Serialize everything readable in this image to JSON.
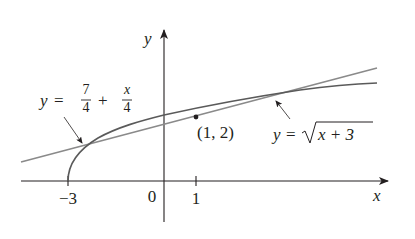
{
  "diagram": {
    "type": "function-graph",
    "axes": {
      "x_label": "x",
      "y_label": "y",
      "origin_label": "0",
      "x_ticks": [
        {
          "value": -3,
          "label": "−3"
        },
        {
          "value": 1,
          "label": "1"
        }
      ]
    },
    "curves": [
      {
        "name": "sqrt-curve",
        "equation": "y = √(x+3)",
        "label_lhs": "y",
        "label_eq": "=",
        "label_radicand": "x + 3",
        "color": "#5a5a5a"
      },
      {
        "name": "tangent-line",
        "equation": "y = 7/4 + x/4",
        "label_lhs": "y",
        "label_eq": "=",
        "label_frac1_num": "7",
        "label_frac1_den": "4",
        "label_plus": "+",
        "label_frac2_num": "x",
        "label_frac2_den": "4",
        "color": "#8a8a8a"
      }
    ],
    "point": {
      "x": 1,
      "y": 2,
      "label": "(1, 2)"
    }
  },
  "colors": {
    "axis": "#231f20",
    "text": "#231f20",
    "background": "#ffffff"
  }
}
